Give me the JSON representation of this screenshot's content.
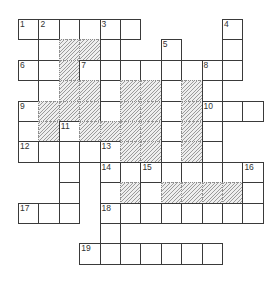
{
  "puzzle": {
    "type": "crossword",
    "cell_size": 20.4,
    "origin": [
      18,
      19
    ],
    "cells": [
      {
        "r": 0,
        "c": 0,
        "n": "1"
      },
      {
        "r": 0,
        "c": 1,
        "n": "2"
      },
      {
        "r": 0,
        "c": 2
      },
      {
        "r": 0,
        "c": 3
      },
      {
        "r": 0,
        "c": 4,
        "n": "3"
      },
      {
        "r": 0,
        "c": 5
      },
      {
        "r": 0,
        "c": 10,
        "n": "4"
      },
      {
        "r": 1,
        "c": 1
      },
      {
        "r": 1,
        "c": 2,
        "s": 1
      },
      {
        "r": 1,
        "c": 3,
        "s": 1
      },
      {
        "r": 1,
        "c": 4
      },
      {
        "r": 1,
        "c": 7,
        "n": "5"
      },
      {
        "r": 1,
        "c": 10
      },
      {
        "r": 2,
        "c": 0,
        "n": "6"
      },
      {
        "r": 2,
        "c": 1
      },
      {
        "r": 2,
        "c": 2,
        "s": 1
      },
      {
        "r": 2,
        "c": 3,
        "n": "7"
      },
      {
        "r": 2,
        "c": 4
      },
      {
        "r": 2,
        "c": 5
      },
      {
        "r": 2,
        "c": 6
      },
      {
        "r": 2,
        "c": 7
      },
      {
        "r": 2,
        "c": 8
      },
      {
        "r": 2,
        "c": 9,
        "n": "8"
      },
      {
        "r": 2,
        "c": 10
      },
      {
        "r": 3,
        "c": 1
      },
      {
        "r": 3,
        "c": 2,
        "s": 1
      },
      {
        "r": 3,
        "c": 3,
        "s": 1
      },
      {
        "r": 3,
        "c": 4
      },
      {
        "r": 3,
        "c": 5,
        "s": 1
      },
      {
        "r": 3,
        "c": 6,
        "s": 1
      },
      {
        "r": 3,
        "c": 7
      },
      {
        "r": 3,
        "c": 8,
        "s": 1
      },
      {
        "r": 3,
        "c": 9
      },
      {
        "r": 4,
        "c": 0,
        "n": "9"
      },
      {
        "r": 4,
        "c": 1,
        "s": 1
      },
      {
        "r": 4,
        "c": 2,
        "s": 1
      },
      {
        "r": 4,
        "c": 3,
        "s": 1
      },
      {
        "r": 4,
        "c": 4
      },
      {
        "r": 4,
        "c": 5,
        "s": 1
      },
      {
        "r": 4,
        "c": 6,
        "s": 1
      },
      {
        "r": 4,
        "c": 7
      },
      {
        "r": 4,
        "c": 8,
        "s": 1
      },
      {
        "r": 4,
        "c": 9,
        "n": "10"
      },
      {
        "r": 4,
        "c": 10
      },
      {
        "r": 4,
        "c": 11
      },
      {
        "r": 5,
        "c": 0
      },
      {
        "r": 5,
        "c": 1,
        "s": 1
      },
      {
        "r": 5,
        "c": 2,
        "n": "11"
      },
      {
        "r": 5,
        "c": 3,
        "s": 1
      },
      {
        "r": 5,
        "c": 4,
        "s": 1
      },
      {
        "r": 5,
        "c": 5,
        "s": 1
      },
      {
        "r": 5,
        "c": 6,
        "s": 1
      },
      {
        "r": 5,
        "c": 7
      },
      {
        "r": 5,
        "c": 8,
        "s": 1
      },
      {
        "r": 5,
        "c": 9
      },
      {
        "r": 6,
        "c": 0,
        "n": "12"
      },
      {
        "r": 6,
        "c": 1
      },
      {
        "r": 6,
        "c": 2
      },
      {
        "r": 6,
        "c": 3
      },
      {
        "r": 6,
        "c": 4,
        "n": "13"
      },
      {
        "r": 6,
        "c": 5,
        "s": 1
      },
      {
        "r": 6,
        "c": 6,
        "s": 1
      },
      {
        "r": 6,
        "c": 7
      },
      {
        "r": 6,
        "c": 8,
        "s": 1
      },
      {
        "r": 6,
        "c": 9
      },
      {
        "r": 7,
        "c": 2
      },
      {
        "r": 7,
        "c": 4,
        "n": "14"
      },
      {
        "r": 7,
        "c": 5
      },
      {
        "r": 7,
        "c": 6,
        "n": "15"
      },
      {
        "r": 7,
        "c": 7
      },
      {
        "r": 7,
        "c": 8
      },
      {
        "r": 7,
        "c": 9
      },
      {
        "r": 7,
        "c": 10
      },
      {
        "r": 7,
        "c": 11,
        "n": "16"
      },
      {
        "r": 8,
        "c": 2
      },
      {
        "r": 8,
        "c": 4
      },
      {
        "r": 8,
        "c": 5,
        "s": 1
      },
      {
        "r": 8,
        "c": 6
      },
      {
        "r": 8,
        "c": 7,
        "s": 1
      },
      {
        "r": 8,
        "c": 8,
        "s": 1
      },
      {
        "r": 8,
        "c": 9,
        "s": 1
      },
      {
        "r": 8,
        "c": 10,
        "s": 1
      },
      {
        "r": 8,
        "c": 11
      },
      {
        "r": 9,
        "c": 0,
        "n": "17"
      },
      {
        "r": 9,
        "c": 1
      },
      {
        "r": 9,
        "c": 2
      },
      {
        "r": 9,
        "c": 4,
        "n": "18"
      },
      {
        "r": 9,
        "c": 5
      },
      {
        "r": 9,
        "c": 6
      },
      {
        "r": 9,
        "c": 7
      },
      {
        "r": 9,
        "c": 8
      },
      {
        "r": 9,
        "c": 9
      },
      {
        "r": 9,
        "c": 10
      },
      {
        "r": 9,
        "c": 11
      },
      {
        "r": 10,
        "c": 4
      },
      {
        "r": 11,
        "c": 3,
        "n": "19"
      },
      {
        "r": 11,
        "c": 4
      },
      {
        "r": 11,
        "c": 5
      },
      {
        "r": 11,
        "c": 6
      },
      {
        "r": 11,
        "c": 7
      },
      {
        "r": 11,
        "c": 8
      },
      {
        "r": 11,
        "c": 9
      }
    ],
    "clue_numbers": [
      "1",
      "2",
      "3",
      "4",
      "5",
      "6",
      "7",
      "8",
      "9",
      "10",
      "11",
      "12",
      "13",
      "14",
      "15",
      "16",
      "17",
      "18",
      "19"
    ]
  }
}
